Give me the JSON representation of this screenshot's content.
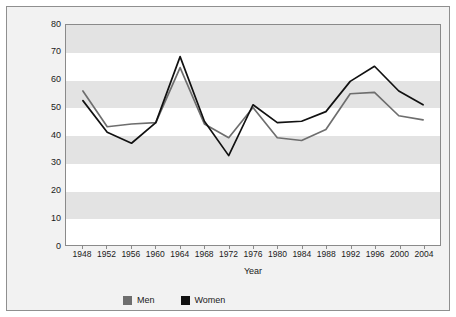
{
  "chart_data": {
    "type": "line",
    "title": "",
    "xlabel": "Year",
    "ylabel": "Percent of the Two-Party Vote for the Democrat",
    "categories": [
      "1948",
      "1952",
      "1956",
      "1960",
      "1964",
      "1968",
      "1972",
      "1976",
      "1980",
      "1984",
      "1988",
      "1992",
      "1996",
      "2000",
      "2004"
    ],
    "x": [
      1948,
      1952,
      1956,
      1960,
      1964,
      1968,
      1972,
      1976,
      1980,
      1984,
      1988,
      1992,
      1996,
      2000,
      2004
    ],
    "series": [
      {
        "name": "Men",
        "color": "#6e6e6e",
        "values": [
          56.0,
          43.0,
          44.0,
          44.5,
          64.5,
          44.0,
          39.0,
          50.0,
          39.0,
          38.0,
          42.0,
          55.0,
          55.5,
          47.0,
          45.5
        ]
      },
      {
        "name": "Women",
        "color": "#111111",
        "values": [
          52.5,
          41.0,
          37.0,
          44.5,
          68.5,
          45.0,
          32.5,
          51.0,
          44.5,
          45.0,
          48.5,
          59.5,
          65.0,
          56.0,
          51.0
        ]
      }
    ],
    "ylim": [
      0,
      80
    ],
    "yticks": [
      0,
      10,
      20,
      30,
      40,
      50,
      60,
      70,
      80
    ],
    "ytick_labels": [
      "0",
      "10",
      "20",
      "30",
      "40",
      "50",
      "60",
      "70",
      "80"
    ],
    "xlim": [
      1948,
      2004
    ],
    "grid": "horizontal-alternating-bands",
    "legend_position": "bottom",
    "legend": [
      {
        "label": "Men",
        "color": "#6e6e6e"
      },
      {
        "label": "Women",
        "color": "#111111"
      }
    ]
  },
  "figure": {
    "background": "#f2f2f2",
    "plot_background": "#ffffff",
    "band_color": "#e3e3e3",
    "border_color": "#8f8f8f"
  }
}
